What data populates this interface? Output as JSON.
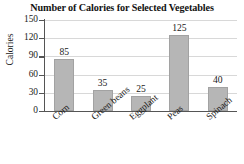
{
  "chart_data": {
    "type": "bar",
    "title": "Number of Calories for Selected Vegetables",
    "xlabel": "",
    "ylabel": "Calories",
    "categories": [
      "Corn",
      "Green beans",
      "Eggplant",
      "Peas",
      "Spinach"
    ],
    "values": [
      85,
      35,
      25,
      125,
      40
    ],
    "value_labels": [
      "85",
      "35",
      "25",
      "125",
      "40"
    ],
    "ylim": [
      0,
      150
    ],
    "yticks": [
      0,
      30,
      60,
      90,
      120,
      150
    ],
    "ytick_labels": [
      "0",
      "30",
      "60",
      "90",
      "120",
      "150"
    ],
    "grid": true,
    "legend": false,
    "bar_color": "#b6b6b6",
    "axis_color": "#555555",
    "grid_color": "#d8d8d8",
    "text_color": "#1a1a1a",
    "background": "#ffffff"
  }
}
